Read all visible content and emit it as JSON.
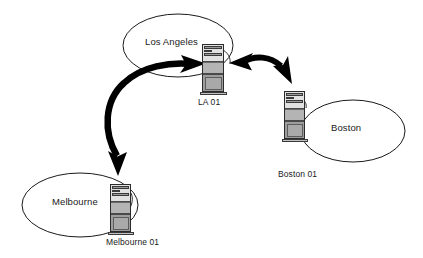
{
  "diagram": {
    "background_color": "#ffffff",
    "line_color": "#1a1a1a",
    "arrow_color": "#000000",
    "sites": [
      {
        "id": "los-angeles",
        "cloud_label": "Los Angeles",
        "node_label": "LA 01",
        "icon": "server-tower-icon"
      },
      {
        "id": "boston",
        "cloud_label": "Boston",
        "node_label": "Boston 01",
        "icon": "server-tower-icon"
      },
      {
        "id": "melbourne",
        "cloud_label": "Melbourne",
        "node_label": "Melbourne 01",
        "icon": "server-tower-icon"
      }
    ],
    "links": [
      {
        "id": "la-boston",
        "from": "los-angeles",
        "to": "boston",
        "style": "double-headed-curved-arrow"
      },
      {
        "id": "la-melbourne",
        "from": "los-angeles",
        "to": "melbourne",
        "style": "double-headed-curved-arrow"
      }
    ]
  }
}
